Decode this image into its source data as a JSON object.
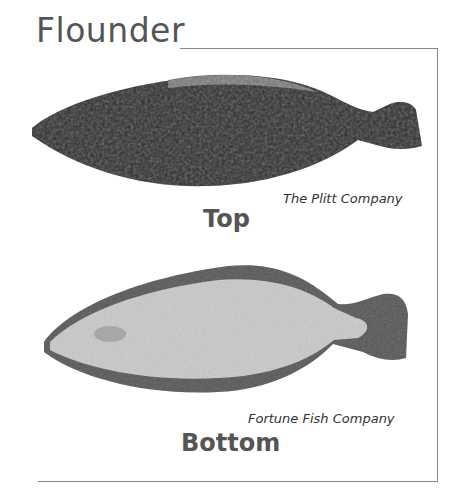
{
  "title": "Flounder",
  "panels": [
    {
      "side_label": "Top",
      "credit": "The Plitt Company",
      "image": "flounder-top-dark-fish-photo"
    },
    {
      "side_label": "Bottom",
      "credit": "Fortune Fish Company",
      "image": "flounder-bottom-light-fish-photo"
    }
  ],
  "colors": {
    "title": "#555555",
    "frame": "#888888",
    "fish_top": "#2a2a2a",
    "fish_bottom_body": "#c8c8c8",
    "fish_bottom_fins": "#555555"
  }
}
